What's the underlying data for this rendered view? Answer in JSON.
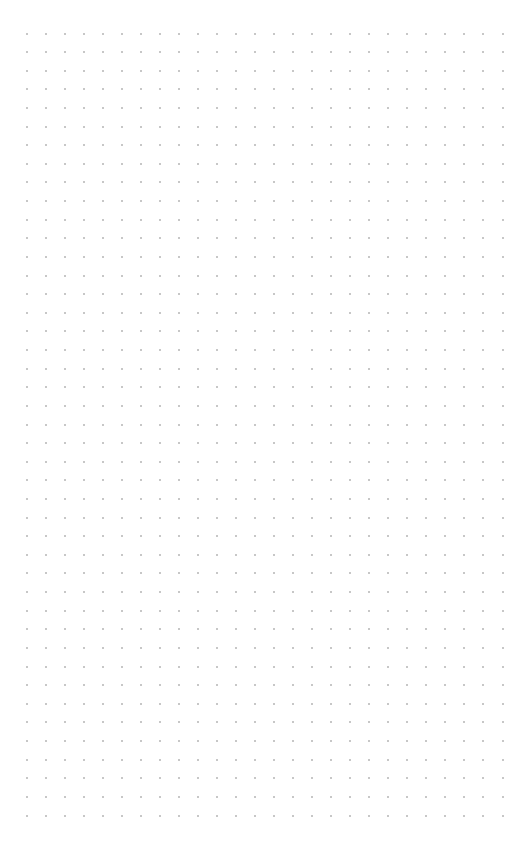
{
  "canvas": {
    "name": "dot-grid-canvas",
    "background": "#ffffff",
    "dot_color": "#b4b4b4",
    "columns": 26,
    "rows": 43,
    "origin_x": 25.5,
    "origin_y": 32.5,
    "spacing_x": 19.04,
    "spacing_y": 18.62
  }
}
